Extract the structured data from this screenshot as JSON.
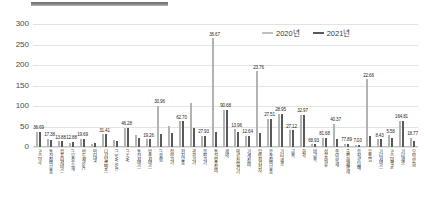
{
  "legend": {
    "position": "top-right",
    "items": [
      {
        "label": "2020년",
        "color": "#bfbfbf"
      },
      {
        "label": "2021년",
        "color": "#595959"
      }
    ]
  },
  "axis": {
    "yticks": [
      "0",
      "50",
      "100",
      "150",
      "200",
      "250",
      "300"
    ]
  },
  "chart_data": {
    "type": "bar",
    "title": "",
    "xlabel": "",
    "ylabel": "",
    "ylim": [
      0,
      300
    ],
    "yticks": [
      0,
      50,
      100,
      150,
      200,
      250,
      300
    ],
    "grid": true,
    "legend_position": "top-right",
    "categories": [
      "코스닥 IT",
      "통신장비·부품",
      "컴퓨터서비스",
      "IT 부품·소재",
      "반도체·SVC",
      "인터넷",
      "디지털콘텐츠",
      "IT S/W·SVC",
      "IT H/W",
      "통신서비스",
      "방송서비스",
      "IT 융합",
      "정보기기",
      "전자부품",
      "광학기기",
      "음향기기",
      "통신방송장비",
      "제약",
      "의료·정밀기기",
      "기계·장비",
      "일반전기전자",
      "운송장비·부품",
      "기타 제조",
      "금속",
      "화학",
      "비금속",
      "섬유·의류",
      "종이·목재",
      "출판·매체복제",
      "음식료·담배",
      "유통업",
      "기타서비스",
      "코스닥평균",
      "기타제조",
      "오락·문화"
    ],
    "series": [
      {
        "name": "2020년",
        "color": "#b3b3b3",
        "values": [
          36.69,
          20.1,
          13.88,
          9.2,
          19.69,
          8.4,
          31.41,
          17.2,
          46.28,
          30.4,
          19.26,
          100.0,
          52.0,
          62.7,
          107.0,
          27.93,
          265.0,
          90.68,
          43.0,
          27.12,
          185.0,
          68.93,
          81.68,
          40.37,
          77.89,
          7.03,
          22.66,
          57.0,
          8.43,
          5.58,
          164.81,
          18.77,
          29.0,
          64.01,
          22.0
        ]
      },
      {
        "name": "2021년",
        "color": "#595959",
        "values": [
          36.69,
          17.38,
          13.88,
          12.88,
          19.69,
          10.2,
          31.41,
          14.5,
          46.28,
          22.8,
          19.26,
          30.96,
          34.5,
          62.7,
          46.0,
          27.93,
          36.67,
          90.68,
          36.67,
          27.12,
          32.97,
          68.93,
          81.68,
          40.37,
          77.89,
          7.03,
          22.66,
          19.2,
          8.43,
          5.58,
          28.0,
          18.77,
          21.5,
          64.01,
          15.0
        ]
      }
    ],
    "data_labels": [
      "36.69",
      "17.38",
      "13.88",
      "12.88",
      "19.69",
      "",
      "31.41",
      "",
      "46.28",
      "",
      "19.26",
      "30.96",
      "",
      "62.70",
      "",
      "27.93",
      "36.67",
      "90.68",
      "13.96",
      "12.64",
      "23.76",
      "27.51",
      "28.95",
      "27.12",
      "32.97",
      "68.93",
      "81.68",
      "40.37",
      "77.89",
      "7.03",
      "22.66",
      "8.43",
      "5.58",
      "164.81",
      "18.77",
      "64.01"
    ]
  }
}
